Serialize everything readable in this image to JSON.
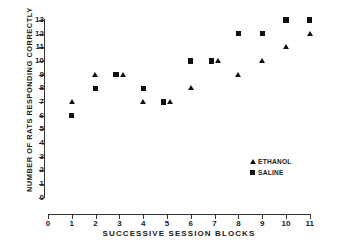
{
  "chart_data": {
    "type": "scatter",
    "title": "",
    "xlabel": "SUCCESSIVE  SESSION  BLOCKS",
    "ylabel": "NUMBER OF RATS  RESPONDING  CORRECTLY",
    "xlim": [
      0,
      11
    ],
    "ylim": [
      0,
      13
    ],
    "grid": false,
    "legend_position": "inside-lower-right",
    "x_ticks": [
      "0",
      "1",
      "2",
      "3",
      "4",
      "5",
      "6",
      "7",
      "8",
      "9",
      "10",
      "11"
    ],
    "y_ticks": [
      "0",
      "1",
      "2",
      "3",
      "4",
      "5",
      "6",
      "7",
      "8",
      "9",
      "10",
      "11",
      "12",
      "13"
    ],
    "x": [
      1,
      2,
      3,
      4,
      5,
      6,
      7,
      8,
      9,
      10,
      11
    ],
    "series": [
      {
        "name": "ETHANOL",
        "marker": "triangle",
        "color": "#111111",
        "values": [
          7,
          9,
          9,
          7,
          7,
          8,
          10,
          9,
          10,
          11,
          12
        ]
      },
      {
        "name": "SALINE",
        "marker": "square",
        "color": "#111111",
        "values": [
          6,
          8,
          9,
          8,
          7,
          10,
          10,
          12,
          12,
          13,
          13
        ]
      }
    ]
  },
  "legend": {
    "items": [
      {
        "label": "ETHANOL",
        "marker": "triangle"
      },
      {
        "label": "SALINE",
        "marker": "square"
      }
    ]
  }
}
